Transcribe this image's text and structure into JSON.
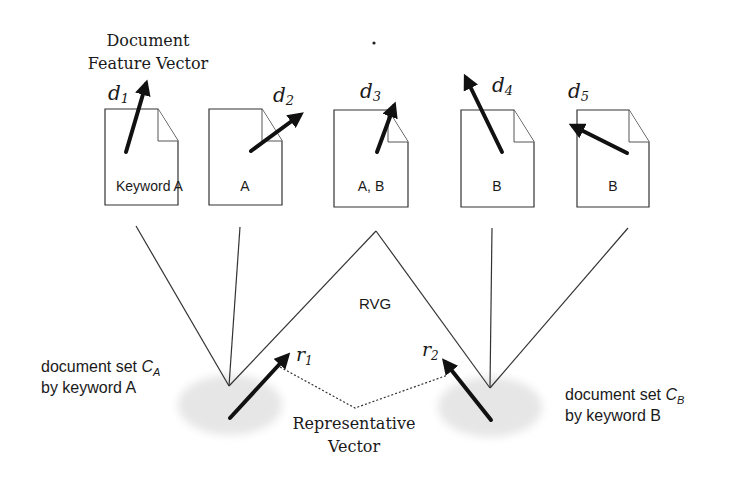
{
  "title": {
    "line1": "Document",
    "line2": "Feature Vector"
  },
  "documents": [
    {
      "id": "d1",
      "label_main": "d",
      "label_sub": "1",
      "keyword": "Keyword A"
    },
    {
      "id": "d2",
      "label_main": "d",
      "label_sub": "2",
      "keyword": "A"
    },
    {
      "id": "d3",
      "label_main": "d",
      "label_sub": "3",
      "keyword": "A, B"
    },
    {
      "id": "d4",
      "label_main": "d",
      "label_sub": "4",
      "keyword": "B"
    },
    {
      "id": "d5",
      "label_main": "d",
      "label_sub": "5",
      "keyword": "B"
    }
  ],
  "graph": {
    "label": "RVG"
  },
  "clusters": {
    "a": {
      "line1_prefix": "document set ",
      "symbol": "C",
      "symbol_sub": "A",
      "line2": "by keyword A",
      "vector_main": "r",
      "vector_sub": "1"
    },
    "b": {
      "line1_prefix": "document set ",
      "symbol": "C",
      "symbol_sub": "B",
      "line2": "by keyword B",
      "vector_main": "r",
      "vector_sub": "2"
    }
  },
  "representative": {
    "line1": "Representative",
    "line2": "Vector"
  },
  "colors": {
    "stroke": "#333333",
    "vector": "#111111",
    "cluster_fill": "#e6e6e6"
  }
}
